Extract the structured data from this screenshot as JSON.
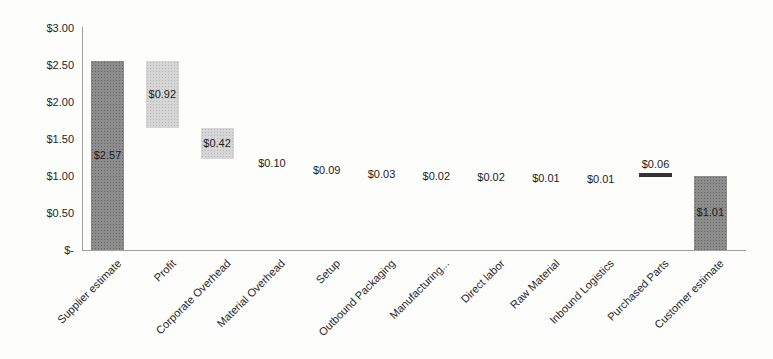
{
  "chart_data": {
    "type": "bar",
    "subtype": "waterfall",
    "title": "",
    "xlabel": "",
    "ylabel": "",
    "ylim": [
      0,
      3.0
    ],
    "grid": false,
    "legend": "none",
    "y_ticks": [
      {
        "label": "$3.00",
        "value": 3.0
      },
      {
        "label": "$2.50",
        "value": 2.5
      },
      {
        "label": "$2.00",
        "value": 2.0
      },
      {
        "label": "$1.50",
        "value": 1.5
      },
      {
        "label": "$1.00",
        "value": 1.0
      },
      {
        "label": "$0.50",
        "value": 0.5
      },
      {
        "label": "$-",
        "value": 0.0
      }
    ],
    "categories": [
      "Supplier estimate",
      "Profit",
      "Corporate Overhead",
      "Material Overhead",
      "Setup",
      "Outbound Packaging",
      "Manufacturing...",
      "Direct labor",
      "Raw Material",
      "Inbound Logistics",
      "Purchased Parts",
      "Customer estimate"
    ],
    "values": [
      2.57,
      0.92,
      0.42,
      0.1,
      0.09,
      0.03,
      0.02,
      0.02,
      0.01,
      0.01,
      0.06,
      1.01
    ],
    "bars": [
      {
        "category": "Supplier estimate",
        "value": 2.57,
        "value_label": "$2.57",
        "start": 0.0,
        "end": 2.57,
        "style": "dark",
        "label_pos": "inside"
      },
      {
        "category": "Profit",
        "value": 0.92,
        "value_label": "$0.92",
        "start": 1.65,
        "end": 2.57,
        "style": "light",
        "label_pos": "inside"
      },
      {
        "category": "Corporate Overhead",
        "value": 0.42,
        "value_label": "$0.42",
        "start": 1.23,
        "end": 1.65,
        "style": "light",
        "label_pos": "inside"
      },
      {
        "category": "Material Overhead",
        "value": 0.1,
        "value_label": "$0.10",
        "start": 1.13,
        "end": 1.23,
        "style": "invisible",
        "label_pos": "center"
      },
      {
        "category": "Setup",
        "value": 0.09,
        "value_label": "$0.09",
        "start": 1.04,
        "end": 1.13,
        "style": "invisible",
        "label_pos": "center"
      },
      {
        "category": "Outbound Packaging",
        "value": 0.03,
        "value_label": "$0.03",
        "start": 1.01,
        "end": 1.04,
        "style": "invisible",
        "label_pos": "center"
      },
      {
        "category": "Manufacturing...",
        "value": 0.02,
        "value_label": "$0.02",
        "start": 0.99,
        "end": 1.01,
        "style": "invisible",
        "label_pos": "center"
      },
      {
        "category": "Direct labor",
        "value": 0.02,
        "value_label": "$0.02",
        "start": 0.97,
        "end": 0.99,
        "style": "invisible",
        "label_pos": "center"
      },
      {
        "category": "Raw Material",
        "value": 0.01,
        "value_label": "$0.01",
        "start": 0.96,
        "end": 0.97,
        "style": "invisible",
        "label_pos": "center"
      },
      {
        "category": "Inbound Logistics",
        "value": 0.01,
        "value_label": "$0.01",
        "start": 0.95,
        "end": 0.96,
        "style": "invisible",
        "label_pos": "center"
      },
      {
        "category": "Purchased Parts",
        "value": 0.06,
        "value_label": "$0.06",
        "start": 0.99,
        "end": 1.05,
        "style": "dark-line",
        "label_pos": "above"
      },
      {
        "category": "Customer estimate",
        "value": 1.01,
        "value_label": "$1.01",
        "start": 0.0,
        "end": 1.01,
        "style": "dark",
        "label_pos": "inside"
      }
    ],
    "colors": {
      "dark_bar": "#8d8d8d",
      "light_bar": "#d6d6d6",
      "line_bar": "#333333",
      "axis": "#9f9f9f",
      "text": "#262626"
    }
  }
}
